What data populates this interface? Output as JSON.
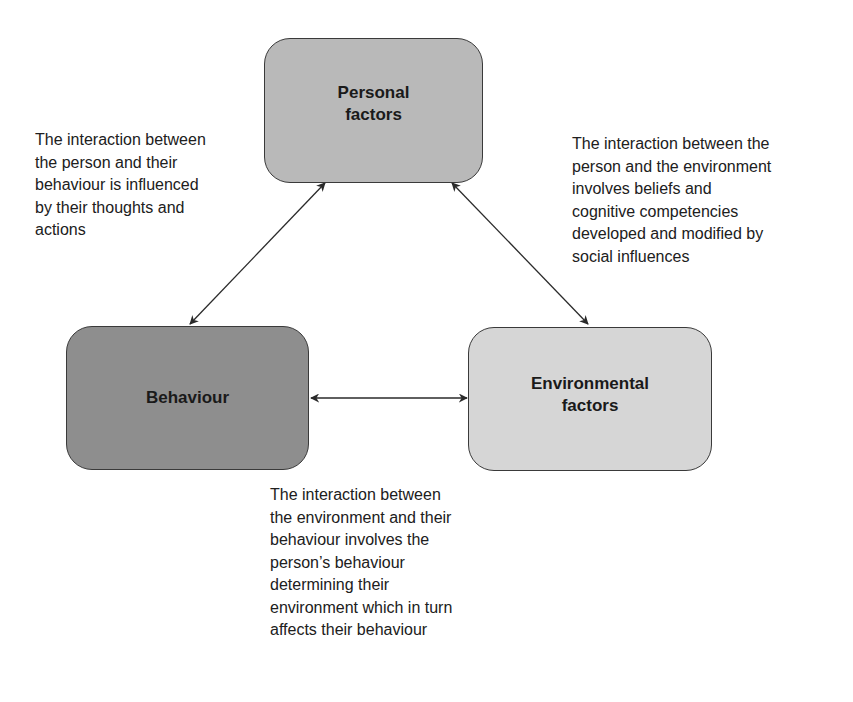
{
  "diagram": {
    "nodes": [
      {
        "id": "personal",
        "label_line1": "Personal",
        "label_line2": "factors",
        "fill": "#b9b9b9"
      },
      {
        "id": "behaviour",
        "label_line1": "Behaviour",
        "label_line2": "",
        "fill": "#8e8e8e"
      },
      {
        "id": "environmental",
        "label_line1": "Environmental",
        "label_line2": "factors",
        "fill": "#d6d6d6"
      }
    ],
    "edges": [
      {
        "from": "personal",
        "to": "behaviour",
        "direction": "bidirectional"
      },
      {
        "from": "personal",
        "to": "environmental",
        "direction": "bidirectional"
      },
      {
        "from": "behaviour",
        "to": "environmental",
        "direction": "bidirectional"
      }
    ],
    "annotations": {
      "personal_behaviour": "The interaction between\nthe person and their\nbehaviour is influenced\nby their thoughts and\nactions",
      "personal_environment": "The interaction between the\nperson and the environment\ninvolves beliefs and\ncognitive competencies\ndeveloped and modified by\nsocial influences",
      "environment_behaviour": "The interaction between\nthe environment and their\nbehaviour involves the\nperson’s behaviour\ndetermining their\nenvironment which in turn\naffects their behaviour"
    }
  }
}
